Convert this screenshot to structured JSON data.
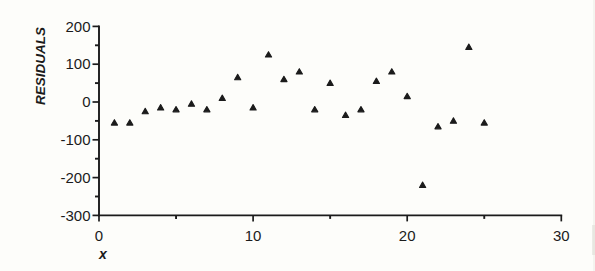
{
  "ink_color": "#1b1b1b",
  "background_color": "#fdfdfa",
  "chart_data": {
    "type": "scatter",
    "title": "",
    "xlabel": "x",
    "ylabel": "RESIDUALS",
    "marker": "filled-triangle-up",
    "marker_color": "#1b1b1b",
    "grid": false,
    "legend": "none",
    "xlim": [
      0,
      30
    ],
    "ylim": [
      -300,
      200
    ],
    "x_major_ticks": [
      0,
      10,
      20,
      30
    ],
    "x_minor_ticks": [
      5,
      15,
      25
    ],
    "y_major_ticks": [
      200,
      100,
      0,
      -100,
      -200,
      -300
    ],
    "y_minor_ticks": [
      150,
      50,
      -50,
      -150,
      -250
    ],
    "points": [
      {
        "x": 1,
        "y": -55
      },
      {
        "x": 2,
        "y": -55
      },
      {
        "x": 3,
        "y": -25
      },
      {
        "x": 4,
        "y": -15
      },
      {
        "x": 5,
        "y": -20
      },
      {
        "x": 6,
        "y": -5
      },
      {
        "x": 7,
        "y": -20
      },
      {
        "x": 8,
        "y": 10
      },
      {
        "x": 9,
        "y": 65
      },
      {
        "x": 10,
        "y": -15
      },
      {
        "x": 11,
        "y": 125
      },
      {
        "x": 12,
        "y": 60
      },
      {
        "x": 13,
        "y": 80
      },
      {
        "x": 14,
        "y": -20
      },
      {
        "x": 15,
        "y": 50
      },
      {
        "x": 16,
        "y": -35
      },
      {
        "x": 17,
        "y": -20
      },
      {
        "x": 18,
        "y": 55
      },
      {
        "x": 19,
        "y": 80
      },
      {
        "x": 20,
        "y": 15
      },
      {
        "x": 21,
        "y": -220
      },
      {
        "x": 22,
        "y": -65
      },
      {
        "x": 23,
        "y": -50
      },
      {
        "x": 24,
        "y": 145
      },
      {
        "x": 25,
        "y": -55
      }
    ]
  }
}
